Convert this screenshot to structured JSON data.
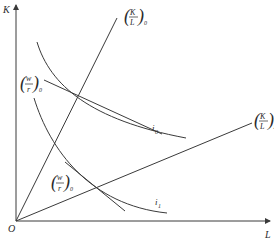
{
  "diagram": {
    "title": "",
    "axes": {
      "y_label": "K",
      "x_label": "L",
      "origin_label": "O"
    },
    "rays": [
      {
        "name": "capital-labor-ratio-0",
        "label_num": "K",
        "label_den": "L",
        "subscript": "0"
      },
      {
        "name": "capital-labor-ratio-1",
        "label_num": "K",
        "label_den": "L",
        "subscript": "1"
      }
    ],
    "isoquants": [
      {
        "name": "isoquant-0",
        "label": "i",
        "subscript": "0"
      },
      {
        "name": "isoquant-1",
        "label": "i",
        "subscript": "1"
      }
    ],
    "price_ratio_lines": [
      {
        "name": "price-ratio-upper",
        "label_num": "w",
        "label_den": "r",
        "subscript": "0"
      },
      {
        "name": "price-ratio-lower",
        "label_num": "w",
        "label_den": "r",
        "subscript": "0"
      }
    ],
    "colors": {
      "ink": "#3a3a3a",
      "background": "#ffffff"
    }
  }
}
